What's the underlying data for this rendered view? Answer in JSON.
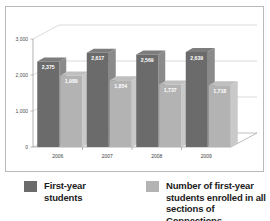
{
  "chart_data": {
    "type": "bar",
    "title": "",
    "subtitle": "",
    "xlabel": "",
    "ylabel": "",
    "categories": [
      "2006",
      "2007",
      "2008",
      "2009"
    ],
    "series": [
      {
        "name": "First-year students",
        "color": "#6b6b6b",
        "values": [
          2375,
          2617,
          2569,
          2639
        ],
        "labels": [
          "2,375",
          "2,617",
          "2,569",
          "2,639"
        ]
      },
      {
        "name": "Number of first-year students enrolled in all sections of Connections",
        "color": "#b3b3b3",
        "values": [
          1989,
          1854,
          1737,
          1718
        ],
        "labels": [
          "1,989",
          "1,854",
          "1,737",
          "1,718"
        ]
      }
    ],
    "ylim": [
      0,
      3000
    ],
    "yticks": [
      0,
      1000,
      2000,
      3000
    ],
    "ytick_labels": [
      "0",
      "1,000",
      "2,000",
      "3,000"
    ],
    "grid": true,
    "legend_position": "bottom",
    "three_d": true
  },
  "legend": {
    "entries": [
      {
        "label": "First-year students",
        "swatch": "dark"
      },
      {
        "label": "Number of first-year\nstudents enrolled in all\nsections of Connections",
        "swatch": "light"
      }
    ]
  },
  "colors": {
    "series_dark_front": "#6b6b6b",
    "series_dark_side": "#8a8a8a",
    "series_dark_top": "#7d7d7d",
    "series_light_front": "#b3b3b3",
    "series_light_side": "#c9c9c9",
    "series_light_top": "#bfbfbf",
    "frame": "#b9b9b9",
    "grid": "#bdbdbd",
    "axis": "#8f8f8f",
    "background": "#ffffff",
    "label_text": "#ffffff",
    "tick_text": "#4a4a4a"
  }
}
